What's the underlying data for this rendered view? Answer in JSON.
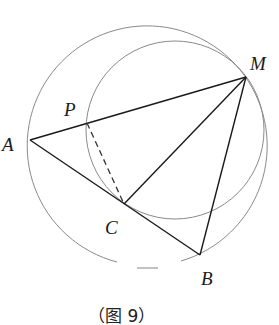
{
  "figure": {
    "caption": "（图 9）",
    "colors": {
      "circle_stroke": "#8a8a8a",
      "segment_stroke": "#1a1a1a",
      "dashed_stroke": "#333333"
    },
    "points": {
      "A": {
        "label": "A",
        "x": 30,
        "y": 140
      },
      "M": {
        "label": "M",
        "x": 246,
        "y": 77
      },
      "P": {
        "label": "P",
        "x": 87,
        "y": 123
      },
      "C": {
        "label": "C",
        "x": 124,
        "y": 204
      },
      "B": {
        "label": "B",
        "x": 200,
        "y": 255
      }
    },
    "circles": [
      {
        "name": "large-circle",
        "cx": 147,
        "cy": 146,
        "r": 120,
        "note": "passes through A, M, B; small gap at bottom"
      },
      {
        "name": "small-circle",
        "cx": 175,
        "cy": 130,
        "r": 89,
        "note": "passes through P, M, C"
      }
    ],
    "segments": [
      {
        "from": "A",
        "to": "M",
        "style": "solid"
      },
      {
        "from": "A",
        "to": "B",
        "style": "solid"
      },
      {
        "from": "M",
        "to": "C",
        "style": "solid"
      },
      {
        "from": "M",
        "to": "B",
        "style": "solid"
      },
      {
        "from": "P",
        "to": "C",
        "style": "dashed"
      }
    ]
  }
}
